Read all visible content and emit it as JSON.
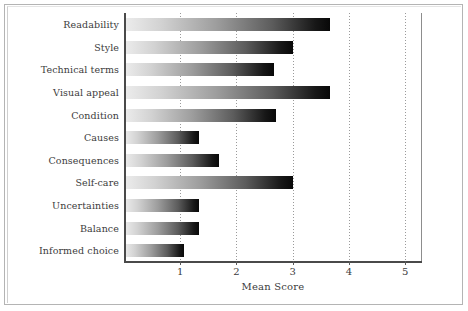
{
  "chart_data": {
    "type": "bar",
    "orientation": "horizontal",
    "title": "",
    "xlabel": "Mean Score",
    "ylabel": "",
    "xlim": [
      0,
      5.3
    ],
    "xticks": [
      1,
      2,
      3,
      4,
      5
    ],
    "xtick_labels": [
      "1",
      "2",
      "3",
      "4",
      "5"
    ],
    "grid": true,
    "grid_axis": "x",
    "grid_style": "dotted",
    "legend": false,
    "categories": [
      "Readability",
      "Style",
      "Technical terms",
      "Visual appeal",
      "Condition",
      "Causes",
      "Consequences",
      "Self-care",
      "Uncertainties",
      "Balance",
      "Informed choice"
    ],
    "values": [
      3.66,
      3.0,
      2.66,
      3.66,
      2.7,
      1.33,
      1.69,
      3.0,
      1.33,
      1.34,
      1.06
    ],
    "series": [
      {
        "name": "Mean Score",
        "values": [
          3.66,
          3.0,
          2.66,
          3.66,
          2.7,
          1.33,
          1.69,
          3.0,
          1.33,
          1.34,
          1.06
        ]
      }
    ],
    "bar_fill": "gradient-light-to-dark",
    "colors": {
      "bar_gradient_start": "#ededed",
      "bar_gradient_end": "#080808",
      "axis": "#4a4a4a",
      "gridline": "#9a9a9a",
      "text": "#3c3c3c",
      "frame": "#b4b4b4",
      "background": "#ffffff"
    }
  }
}
